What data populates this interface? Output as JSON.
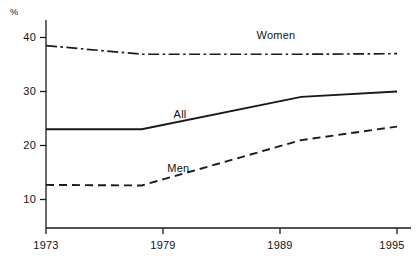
{
  "chart_data": {
    "type": "line",
    "title": "",
    "subtitle": "",
    "xlabel": "",
    "ylabel": "%",
    "x": [
      1973,
      1979,
      1989,
      1995
    ],
    "xtick_labels": [
      "1973",
      "1979",
      "1989",
      "1995"
    ],
    "ytick_labels": [
      "10",
      "20",
      "30",
      "40"
    ],
    "yticks": [
      10,
      20,
      30,
      40
    ],
    "ylim": [
      6.5,
      42.5
    ],
    "xlim": [
      1973,
      1995
    ],
    "grid": false,
    "legend_position": "inline-annotations",
    "series": [
      {
        "name": "Women",
        "label": "Women",
        "linestyle": "dash-dot",
        "color": "#1a1a1a",
        "values": [
          38.5,
          36.9,
          36.9,
          37.0
        ]
      },
      {
        "name": "All",
        "label": "All",
        "linestyle": "solid",
        "color": "#1a1a1a",
        "values": [
          23.0,
          23.0,
          29.0,
          30.0
        ]
      },
      {
        "name": "Men",
        "label": "Men",
        "linestyle": "dashed",
        "color": "#1a1a1a",
        "values": [
          12.7,
          12.6,
          21.0,
          23.5
        ]
      }
    ],
    "annotations": [
      {
        "text": "Women",
        "x": 1986.2,
        "y": 40.2
      },
      {
        "text": "All",
        "x": 1981.0,
        "y": 25.6
      },
      {
        "text": "Men",
        "x": 1980.6,
        "y": 15.6
      }
    ]
  },
  "axis": {
    "unit": "%",
    "ytick_0": "10",
    "ytick_1": "20",
    "ytick_2": "30",
    "ytick_3": "40",
    "xtick_0": "1973",
    "xtick_1": "1979",
    "xtick_2": "1989",
    "xtick_3": "1995"
  },
  "labels": {
    "women": "Women",
    "all": "All",
    "men": "Men"
  },
  "colors": {
    "axis": "#1a1a1a",
    "series": "#1a1a1a",
    "background": "#ffffff"
  }
}
